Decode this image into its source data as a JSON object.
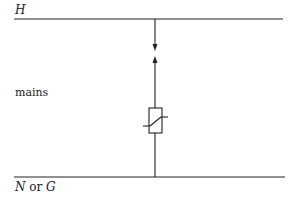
{
  "diagram": {
    "type": "circuit",
    "labels": {
      "top_rail": "H",
      "side": "mains",
      "bottom_rail_part1": "N",
      "bottom_rail_or": " or ",
      "bottom_rail_part2": "G"
    },
    "components": [
      {
        "id": "spark-gap",
        "kind": "arrow-gap",
        "description": "opposing arrows (spark gap) on vertical branch"
      },
      {
        "id": "varistor",
        "kind": "voltage-dependent-resistor",
        "description": "rectangle with diagonal slash and tails (VDR / varistor)"
      }
    ],
    "colors": {
      "line": "#222222",
      "background": "#ffffff"
    }
  }
}
